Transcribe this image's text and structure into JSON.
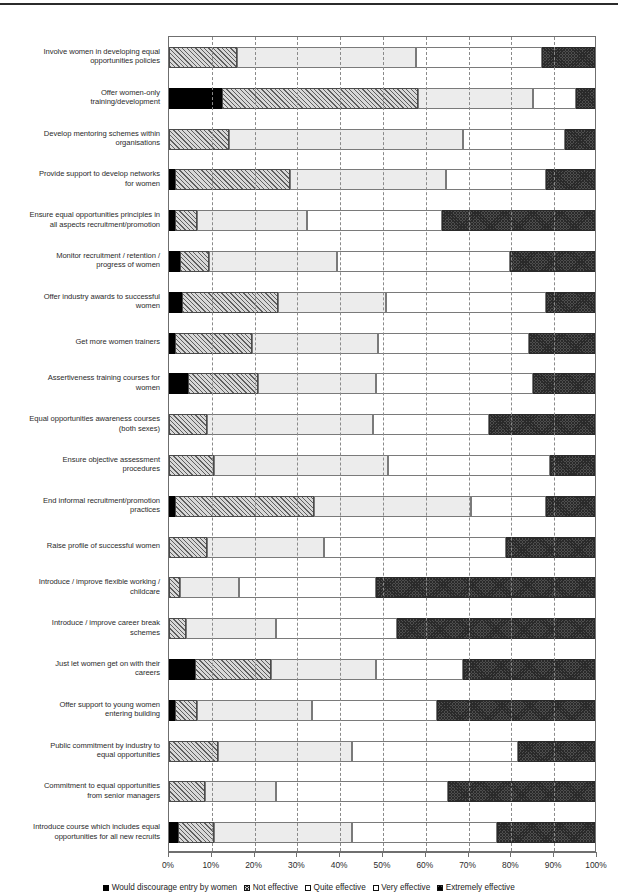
{
  "top_rule": true,
  "chart_data": {
    "type": "bar",
    "orientation": "horizontal",
    "stacked": true,
    "stack_mode": "percent",
    "title": "",
    "xlabel": "",
    "ylabel": "",
    "xlim": [
      0,
      100
    ],
    "grid": true,
    "legend_position": "bottom",
    "x_tick_labels": [
      "0%",
      "10%",
      "20%",
      "30%",
      "40%",
      "50%",
      "60%",
      "70%",
      "80%",
      "90%",
      "100%"
    ],
    "x_tick_values": [
      0,
      10,
      20,
      30,
      40,
      50,
      60,
      70,
      80,
      90,
      100
    ],
    "series": [
      {
        "name": "Would discourage entry by women",
        "key": "s0",
        "pattern": "solid-black"
      },
      {
        "name": "Not effective",
        "key": "s1",
        "pattern": "diagonal-hatch"
      },
      {
        "name": "Quite effective",
        "key": "s2",
        "pattern": "light-grey"
      },
      {
        "name": "Very effective",
        "key": "s3",
        "pattern": "white"
      },
      {
        "name": "Extremely effective",
        "key": "s4",
        "pattern": "dark-checker"
      }
    ],
    "categories": [
      "Involve women in developing equal opportunities policies",
      "Offer women-only training/development",
      "Develop mentoring schemes within organisations",
      "Provide support to develop networks for women",
      "Ensure equal opportunities principles in all aspects recruitment/promotion",
      "Monitor recruitment / retention / progress of women",
      "Offer industry awards to successful women",
      "Get more women trainers",
      "Assertiveness training courses for women",
      "Equal opportunities awareness courses (both sexes)",
      "Ensure objective assessment procedures",
      "End informal recruitment/promotion practices",
      "Raise profile of successful women",
      "Introduce / improve flexible working / childcare",
      "Introduce / improve career break schemes",
      "Just let women get on with their careers",
      "Offer support to young women entering building",
      "Public commitment by industry to equal opportunities",
      "Commitment to equal opportunities from senior managers",
      "Introduce course which includes equal opportunities for all new recruits"
    ],
    "category_lines": [
      [
        "Involve women in developing equal",
        "opportunities policies"
      ],
      [
        "Offer women-only",
        "training/development"
      ],
      [
        "Develop mentoring schemes within",
        "organisations"
      ],
      [
        "Provide support to develop networks",
        "for women"
      ],
      [
        "Ensure equal opportunities principles in",
        "all aspects recruitment/promotion"
      ],
      [
        "Monitor recruitment / retention /",
        "progress of women"
      ],
      [
        "Offer industry awards to successful",
        "women"
      ],
      [
        "Get more women trainers"
      ],
      [
        "Assertiveness training courses for",
        "women"
      ],
      [
        "Equal opportunities awareness courses",
        "(both sexes)"
      ],
      [
        "Ensure objective assessment",
        "procedures"
      ],
      [
        "End informal recruitment/promotion",
        "practices"
      ],
      [
        "Raise profile of successful women"
      ],
      [
        "Introduce / improve flexible working /",
        "childcare"
      ],
      [
        "Introduce / improve career break",
        "schemes"
      ],
      [
        "Just let women get on with their",
        "careers"
      ],
      [
        "Offer support to young women",
        "entering building"
      ],
      [
        "Public commitment by industry to",
        "equal opportunities"
      ],
      [
        "Commitment to equal opportunities",
        "from senior managers"
      ],
      [
        "Introduce course which includes equal",
        "opportunities for all new recruits"
      ]
    ],
    "values": [
      [
        0.0,
        16.0,
        42.0,
        29.5,
        12.5
      ],
      [
        12.5,
        46.0,
        27.0,
        10.0,
        4.5
      ],
      [
        0.0,
        14.0,
        55.0,
        24.0,
        7.0
      ],
      [
        1.5,
        27.0,
        36.5,
        23.5,
        11.5
      ],
      [
        1.5,
        5.0,
        26.0,
        31.5,
        36.0
      ],
      [
        2.5,
        7.0,
        30.0,
        40.5,
        20.0
      ],
      [
        3.0,
        22.5,
        25.5,
        37.5,
        11.5
      ],
      [
        1.5,
        18.0,
        29.5,
        35.5,
        15.5
      ],
      [
        4.5,
        16.5,
        27.5,
        37.0,
        14.5
      ],
      [
        0.0,
        9.0,
        39.0,
        27.0,
        25.0
      ],
      [
        0.0,
        10.5,
        41.0,
        38.0,
        10.5
      ],
      [
        1.5,
        32.5,
        37.0,
        17.5,
        11.5
      ],
      [
        0.0,
        9.0,
        27.5,
        42.5,
        21.0
      ],
      [
        0.0,
        2.5,
        14.0,
        32.0,
        51.5
      ],
      [
        0.0,
        4.0,
        21.0,
        28.5,
        46.5
      ],
      [
        6.0,
        18.0,
        24.5,
        20.5,
        31.0
      ],
      [
        1.5,
        5.0,
        27.0,
        29.5,
        37.0
      ],
      [
        0.0,
        11.5,
        31.5,
        39.0,
        18.0
      ],
      [
        0.0,
        8.5,
        16.5,
        40.5,
        34.5
      ],
      [
        2.0,
        8.5,
        32.5,
        34.0,
        23.0
      ]
    ]
  }
}
